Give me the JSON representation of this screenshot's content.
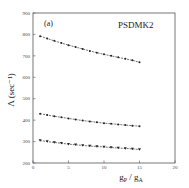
{
  "chart_data": {
    "type": "line",
    "title": "PSDMK2",
    "panel_label": "(a)",
    "xlabel": "g_P / g_A",
    "xlabel_main": "g",
    "xlabel_sub1": "P",
    "xlabel_sep": " / g",
    "xlabel_sub2": "A",
    "ylabel": "Λ (sec⁻¹)",
    "xlim": [
      0,
      20
    ],
    "ylim": [
      200,
      900
    ],
    "xticks": [
      0,
      5,
      10,
      15,
      20
    ],
    "yticks": [
      200,
      300,
      400,
      500,
      600,
      700,
      800,
      900
    ],
    "grid": false,
    "legend": "none",
    "x": [
      1,
      2,
      3,
      4,
      5,
      6,
      7,
      8,
      9,
      10,
      11,
      12,
      13,
      14,
      15
    ],
    "series": [
      {
        "name": "upper",
        "marker": "circle",
        "values": [
          792,
          781,
          770,
          760,
          750,
          741,
          732,
          723,
          715,
          707,
          700,
          693,
          686,
          679,
          670
        ]
      },
      {
        "name": "middle",
        "marker": "circle",
        "values": [
          430,
          424,
          418,
          413,
          408,
          403,
          398,
          394,
          390,
          386,
          383,
          380,
          377,
          374,
          372
        ]
      },
      {
        "name": "lower",
        "marker": "triangle-down",
        "values": [
          305,
          300,
          296,
          292,
          288,
          285,
          282,
          279,
          277,
          275,
          272,
          270,
          268,
          266,
          263
        ]
      }
    ]
  }
}
